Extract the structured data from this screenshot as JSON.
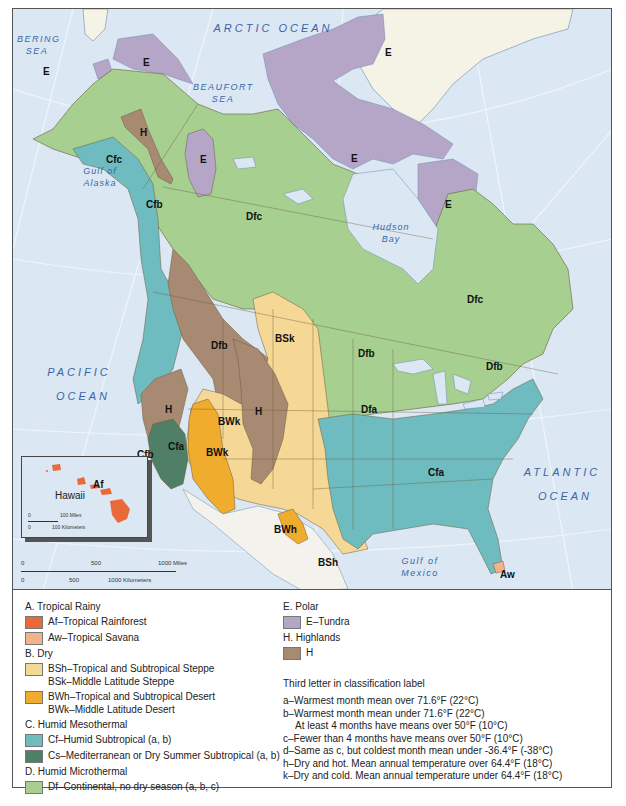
{
  "map": {
    "oceans": [
      {
        "id": "arctic",
        "text": "ARCTIC OCEAN"
      },
      {
        "id": "bering",
        "text": "BERING SEA"
      },
      {
        "id": "beaufort",
        "text": "BEAUFORT SEA"
      },
      {
        "id": "gulf_alaska",
        "text": "Gulf of Alaska"
      },
      {
        "id": "hudson",
        "text": "Hudson Bay"
      },
      {
        "id": "pacific_1",
        "text": "PACIFIC"
      },
      {
        "id": "pacific_2",
        "text": "OCEAN"
      },
      {
        "id": "atlantic_1",
        "text": "ATLANTIC"
      },
      {
        "id": "atlantic_2",
        "text": "OCEAN"
      },
      {
        "id": "gulf_mexico",
        "text": "Gulf of Mexico"
      }
    ],
    "climate_labels": [
      {
        "code": "E",
        "x": 30,
        "y": 57
      },
      {
        "code": "E",
        "x": 130,
        "y": 48
      },
      {
        "code": "E",
        "x": 372,
        "y": 38
      },
      {
        "code": "H",
        "x": 127,
        "y": 118
      },
      {
        "code": "E",
        "x": 187,
        "y": 145
      },
      {
        "code": "E",
        "x": 338,
        "y": 144
      },
      {
        "code": "Cfc",
        "x": 93,
        "y": 145
      },
      {
        "code": "E",
        "x": 432,
        "y": 190
      },
      {
        "code": "Dfc",
        "x": 233,
        "y": 202
      },
      {
        "code": "Dfc",
        "x": 454,
        "y": 285
      },
      {
        "code": "Cfb",
        "x": 133,
        "y": 190
      },
      {
        "code": "Dfb",
        "x": 198,
        "y": 331
      },
      {
        "code": "BSk",
        "x": 262,
        "y": 324
      },
      {
        "code": "Dfb",
        "x": 345,
        "y": 339
      },
      {
        "code": "Dfb",
        "x": 473,
        "y": 352
      },
      {
        "code": "Dfa",
        "x": 348,
        "y": 395
      },
      {
        "code": "H",
        "x": 152,
        "y": 395
      },
      {
        "code": "H",
        "x": 242,
        "y": 397
      },
      {
        "code": "BWk",
        "x": 205,
        "y": 407
      },
      {
        "code": "Cfa",
        "x": 155,
        "y": 432
      },
      {
        "code": "BWk",
        "x": 193,
        "y": 438
      },
      {
        "code": "Cfb",
        "x": 124,
        "y": 440
      },
      {
        "code": "Cfa",
        "x": 415,
        "y": 458
      },
      {
        "code": "BWh",
        "x": 261,
        "y": 515
      },
      {
        "code": "BSh",
        "x": 305,
        "y": 548
      },
      {
        "code": "Aw",
        "x": 487,
        "y": 560
      }
    ],
    "hawaii_inset": {
      "name": "Hawaii",
      "code": "Af",
      "scale_miles_zero": "0",
      "scale_miles": "100 Miles",
      "scale_km_zero": "0",
      "scale_km": "100 Kilometers"
    },
    "main_scale": {
      "miles_zero": "0",
      "miles_mid": "500",
      "miles_end": "1000 Miles",
      "km_zero": "0",
      "km_mid": "500",
      "km_end": "1000 Kilometers"
    }
  },
  "colors": {
    "ocean": "#dbe8f3",
    "greenland": "#f4f3e6",
    "mexico": "#f3f2ec",
    "Af": "#e8693a",
    "Aw": "#f1b28c",
    "BS": "#f6d896",
    "BW": "#f0ac2c",
    "Cf": "#6ebcbf",
    "Cs": "#4f7f66",
    "Df": "#a6cf90",
    "E": "#b5a6c7",
    "H": "#a88a72",
    "border": "#6b5a3c",
    "water_text": "#3a64a8"
  },
  "legend": {
    "groups": [
      {
        "heading": "A. Tropical Rainy",
        "items": [
          {
            "color_key": "Af",
            "lines": [
              "Af–Tropical Rainforest"
            ]
          },
          {
            "color_key": "Aw",
            "lines": [
              "Aw–Tropical Savana"
            ]
          }
        ]
      },
      {
        "heading": "B. Dry",
        "items": [
          {
            "color_key": "BS",
            "lines": [
              "BSh–Tropical and Subtropical Steppe",
              "BSk–Middle Latitude Steppe"
            ]
          },
          {
            "color_key": "BW",
            "lines": [
              "BWh–Tropical and Subtropical Desert",
              "BWk–Middle Latitude Desert"
            ]
          }
        ]
      },
      {
        "heading": "C. Humid Mesothermal",
        "items": [
          {
            "color_key": "Cf",
            "lines": [
              "Cf–Humid Subtropical (a, b)"
            ]
          },
          {
            "color_key": "Cs",
            "lines": [
              "Cs–Mediterranean or Dry Summer Subtropical (a, b)"
            ]
          }
        ]
      },
      {
        "heading": "D. Humid Microthermal",
        "items": [
          {
            "color_key": "Df",
            "lines": [
              "Df–Continental, no dry season (a, b, c)"
            ]
          }
        ]
      },
      {
        "heading": "E. Polar",
        "items": [
          {
            "color_key": "E",
            "lines": [
              "E–Tundra"
            ]
          }
        ]
      },
      {
        "heading": "H. Highlands",
        "items": [
          {
            "color_key": "H",
            "lines": [
              "H"
            ]
          }
        ]
      }
    ],
    "third_letter": {
      "title": "Third letter in classification label",
      "items": [
        {
          "text": "a–Warmest month mean over 71.6°F (22°C)",
          "indent": false
        },
        {
          "text": "b–Warmest month mean under 71.6°F (22°C)",
          "indent": false
        },
        {
          "text": "At least 4 months have means over 50°F (10°C)",
          "indent": true
        },
        {
          "text": "c–Fewer than 4 months have means over 50°F (10°C)",
          "indent": false
        },
        {
          "text": "d–Same as c, but coldest month mean under -36.4°F (-38°C)",
          "indent": false
        },
        {
          "text": "h–Dry and hot. Mean annual temperature over 64.4°F (18°C)",
          "indent": false
        },
        {
          "text": "k–Dry and cold. Mean annual temperature under 64.4°F (18°C)",
          "indent": false
        }
      ]
    }
  }
}
